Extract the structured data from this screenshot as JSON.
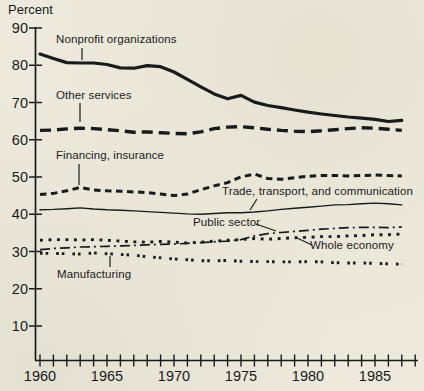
{
  "page": {
    "background_color": "#edeadd",
    "ink_color": "#1a1a1a"
  },
  "chart_data": {
    "type": "line",
    "title": "",
    "xlabel": "",
    "ylabel": "Percent",
    "grid": false,
    "legend_position": "inline-annotations",
    "xlim": [
      1960,
      1988
    ],
    "ylim": [
      0,
      90
    ],
    "y_ticks": [
      90,
      80,
      70,
      60,
      50,
      40,
      30,
      20,
      10
    ],
    "x_tick_labels": [
      1960,
      1965,
      1970,
      1975,
      1980,
      1985
    ],
    "x_minor_tick_step_years": 1,
    "x": [
      1960,
      1961,
      1962,
      1963,
      1964,
      1965,
      1966,
      1967,
      1968,
      1969,
      1970,
      1971,
      1972,
      1973,
      1974,
      1975,
      1976,
      1977,
      1978,
      1979,
      1980,
      1981,
      1982,
      1983,
      1984,
      1985,
      1986,
      1987
    ],
    "series": [
      {
        "name": "Nonprofit organizations",
        "line_style": "thick-solid",
        "values": [
          83,
          81.8,
          80.7,
          80.6,
          80.6,
          80.2,
          79.3,
          79.2,
          79.9,
          79.6,
          78.2,
          76.2,
          74.2,
          72.3,
          71,
          71.9,
          70.1,
          69.2,
          68.6,
          68,
          67.4,
          66.9,
          66.5,
          66.1,
          65.8,
          65.5,
          64.9,
          65.2
        ]
      },
      {
        "name": "Other services",
        "line_style": "bold-dash",
        "values": [
          62.5,
          62.6,
          62.9,
          63.1,
          63,
          62.7,
          62.4,
          62,
          62.1,
          61.9,
          61.7,
          61.6,
          62.1,
          63,
          63.4,
          63.5,
          63.2,
          62.8,
          62.5,
          62.3,
          62.2,
          62.4,
          62.7,
          63,
          63.2,
          63.1,
          62.8,
          62.5
        ]
      },
      {
        "name": "Financing, insurance",
        "line_style": "medium-dash",
        "values": [
          45.3,
          45.6,
          46.3,
          47.2,
          46.5,
          46.3,
          46.2,
          46,
          45.8,
          45.4,
          45,
          45.4,
          46.6,
          47.6,
          48.5,
          50,
          50.8,
          49.6,
          49.4,
          49.8,
          50.2,
          50.4,
          50.4,
          50.3,
          50.4,
          50.5,
          50.4,
          50.3
        ]
      },
      {
        "name": "Trade, transport, and communication",
        "line_style": "thin-solid",
        "values": [
          41.2,
          41.3,
          41.5,
          41.7,
          41.4,
          41.2,
          41.1,
          40.9,
          40.7,
          40.5,
          40.3,
          40.1,
          40,
          40.2,
          40.4,
          40.4,
          40.6,
          40.9,
          41.3,
          41.6,
          41.9,
          42.2,
          42.5,
          42.6,
          42.8,
          43,
          42.8,
          42.5
        ]
      },
      {
        "name": "Public sector",
        "line_style": "dash-dot",
        "values": [
          30.5,
          30.8,
          31,
          31.2,
          31.3,
          31.4,
          31.5,
          31.6,
          31.8,
          31.9,
          32,
          32.2,
          32.4,
          32.6,
          32.8,
          33.2,
          34.2,
          34.8,
          35.1,
          35.4,
          35.7,
          36,
          36.2,
          36.4,
          36.5,
          36.5,
          36.4,
          36.6
        ]
      },
      {
        "name": "Whole economy",
        "line_style": "square-dot",
        "values": [
          33,
          33.2,
          33.2,
          33.1,
          33.2,
          33,
          32.8,
          32.6,
          32.5,
          32.7,
          32.5,
          32.3,
          32.5,
          32.8,
          33,
          33.2,
          33.5,
          33.3,
          33.5,
          33.7,
          33.8,
          34,
          34,
          34.2,
          34.3,
          34.5,
          34.5,
          34.7
        ]
      },
      {
        "name": "Manufacturing",
        "line_style": "double-dot",
        "values": [
          29.5,
          29.5,
          29.4,
          29.3,
          29.6,
          29.4,
          29.2,
          29,
          28.6,
          28.3,
          28,
          27.8,
          27.5,
          27.5,
          27.6,
          27.4,
          27.3,
          27.3,
          27.2,
          27.2,
          27.3,
          27.2,
          27,
          26.9,
          26.9,
          26.8,
          26.7,
          26.6
        ]
      }
    ]
  }
}
